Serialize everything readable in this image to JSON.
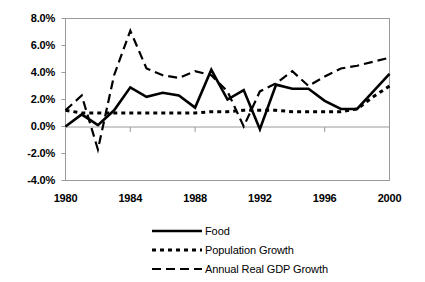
{
  "chart_data": {
    "type": "line",
    "title": "",
    "xlabel": "",
    "ylabel": "",
    "xlim": [
      1980,
      2000
    ],
    "ylim": [
      -0.04,
      0.08
    ],
    "grid": false,
    "legend_position": "bottom",
    "x": [
      1980,
      1981,
      1982,
      1983,
      1984,
      1985,
      1986,
      1987,
      1988,
      1989,
      1990,
      1991,
      1992,
      1993,
      1994,
      1995,
      1996,
      1997,
      1998,
      1999,
      2000
    ],
    "y_tick_labels": [
      "8.0%",
      "6.0%",
      "4.0%",
      "2.0%",
      "0.0%",
      "-2.0%",
      "-4.0%"
    ],
    "y_tick_values": [
      0.08,
      0.06,
      0.04,
      0.02,
      0.0,
      -0.02,
      -0.04
    ],
    "x_tick_labels": [
      "1980",
      "1984",
      "1988",
      "1992",
      "1996",
      "2000"
    ],
    "x_tick_values": [
      1980,
      1984,
      1988,
      1992,
      1996,
      2000
    ],
    "series": [
      {
        "name": "Food",
        "style": "solid",
        "color": "#000000",
        "values": [
          0.0,
          0.009,
          0.001,
          0.012,
          0.029,
          0.022,
          0.025,
          0.023,
          0.014,
          0.042,
          0.02,
          0.027,
          -0.002,
          0.031,
          0.028,
          0.028,
          0.019,
          0.013,
          0.013,
          0.026,
          0.039
        ]
      },
      {
        "name": "Population Growth",
        "style": "dotted",
        "color": "#000000",
        "values": [
          0.012,
          0.01,
          0.01,
          0.01,
          0.01,
          0.01,
          0.01,
          0.01,
          0.01,
          0.011,
          0.011,
          0.012,
          0.012,
          0.012,
          0.011,
          0.011,
          0.011,
          0.011,
          0.013,
          0.022,
          0.03
        ]
      },
      {
        "name": "Annual Real GDP Growth",
        "style": "dashed",
        "color": "#000000",
        "values": [
          0.012,
          0.023,
          -0.017,
          0.038,
          0.071,
          0.043,
          0.038,
          0.036,
          0.041,
          0.038,
          0.026,
          0.0,
          0.026,
          0.032,
          0.041,
          0.03,
          0.037,
          0.043,
          0.045,
          0.048,
          0.051
        ]
      }
    ]
  },
  "legend": {
    "items": [
      {
        "label": "Food",
        "style": "solid"
      },
      {
        "label": "Population Growth",
        "style": "dotted"
      },
      {
        "label": "Annual Real GDP Growth",
        "style": "dashed"
      }
    ]
  },
  "colors": {
    "line": "#000000",
    "axis": "#808080",
    "background": "#ffffff"
  }
}
